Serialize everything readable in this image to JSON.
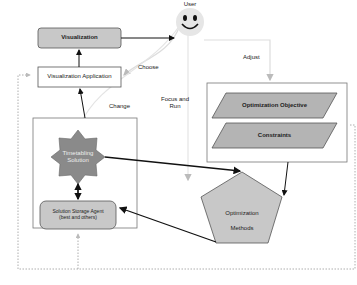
{
  "nodes": {
    "visualization": "Visualization",
    "visualization_application": "Visualization Application",
    "user": "User",
    "optimization_objective": "Optimization Objective",
    "constraints": "Constraints",
    "timetabling_solution_line1": "Timetabling",
    "timetabling_solution_line2": "Solution",
    "solution_storage_line1": "Solution Storage Agent",
    "solution_storage_line2": "(best and others)",
    "optimization_methods_line1": "Optimization",
    "optimization_methods_line2": "Methods"
  },
  "edges": {
    "choose": "Choose",
    "adjust": "Adjust",
    "change": "Change",
    "focus_run_line1": "Focus and",
    "focus_run_line2": "Run"
  },
  "colors": {
    "node_fill": "#c8c8c8",
    "star_fill": "#8a8a8a",
    "user_fill": "#e6e6e6",
    "line": "#111111",
    "faint_line": "#d8d8d8",
    "dotted": "#999999"
  }
}
